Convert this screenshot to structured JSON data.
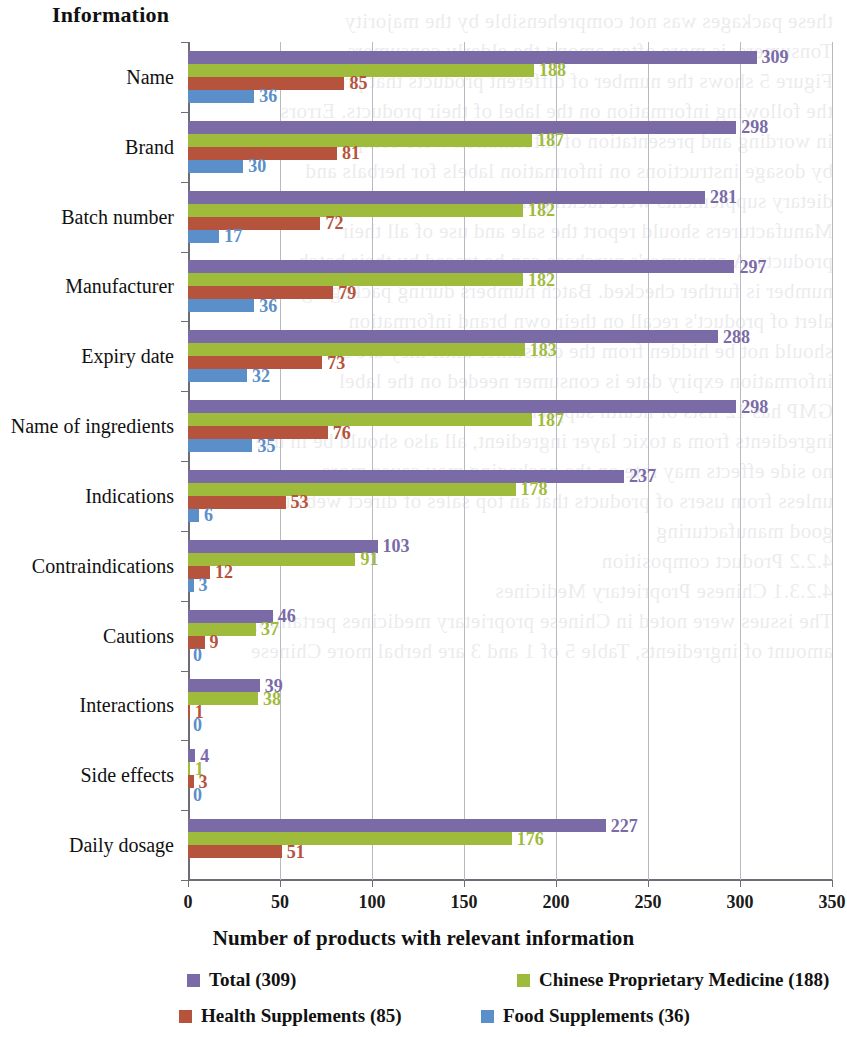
{
  "axis_titles": {
    "y_axis": "Information",
    "x_axis": "Number of products with relevant information"
  },
  "legend": {
    "items": [
      {
        "label": "Total (309)",
        "color": "#7a6aa6",
        "key": "total"
      },
      {
        "label": "Chinese Proprietary Medicine (188)",
        "color": "#9fbb3c",
        "key": "cpm"
      },
      {
        "label": "Health Supplements (85)",
        "color": "#b5533c",
        "key": "health"
      },
      {
        "label": "Food Supplements (36)",
        "color": "#5b8fc9",
        "key": "food"
      }
    ]
  },
  "chart_data": {
    "type": "bar",
    "orientation": "horizontal",
    "title": "",
    "xlabel": "Number of products with relevant information",
    "ylabel": "Information",
    "xlim": [
      0,
      350
    ],
    "xticks": [
      0,
      50,
      100,
      150,
      200,
      250,
      300,
      350
    ],
    "grid": true,
    "legend_position": "bottom",
    "categories": [
      "Name",
      "Brand",
      "Batch number",
      "Manufacturer",
      "Expiry date",
      "Name of ingredients",
      "Indications",
      "Contraindications",
      "Cautions",
      "Interactions",
      "Side effects",
      "Daily dosage"
    ],
    "series": [
      {
        "name": "Total (309)",
        "color": "#7a6aa6",
        "values": [
          309,
          298,
          281,
          297,
          288,
          298,
          237,
          103,
          46,
          39,
          4,
          227
        ],
        "labels": [
          "309",
          "298",
          "281",
          "297",
          "288",
          "298",
          "237",
          "103",
          "46",
          "39",
          "4",
          "227"
        ]
      },
      {
        "name": "Chinese Proprietary Medicine (188)",
        "color": "#9fbb3c",
        "values": [
          188,
          187,
          182,
          182,
          183,
          187,
          178,
          91,
          37,
          38,
          1,
          176
        ],
        "labels": [
          "188",
          "187",
          "182",
          "182",
          "183",
          "187",
          "178",
          "91",
          "37",
          "38",
          "1",
          "176"
        ]
      },
      {
        "name": "Health Supplements (85)",
        "color": "#b5533c",
        "values": [
          85,
          81,
          72,
          79,
          73,
          76,
          53,
          12,
          9,
          1,
          3,
          51
        ],
        "labels": [
          "85",
          "81",
          "72",
          "79",
          "73",
          "76",
          "53",
          "12",
          "9",
          "1",
          "3",
          "51"
        ]
      },
      {
        "name": "Food Supplements (36)",
        "color": "#5b8fc9",
        "values": [
          36,
          30,
          17,
          36,
          32,
          35,
          6,
          3,
          0,
          0,
          0,
          0
        ],
        "labels": [
          "36",
          "30",
          "17",
          "36",
          "32",
          "35",
          "6",
          "3",
          "0",
          "0",
          "0",
          ""
        ]
      }
    ]
  },
  "ghost_text": [
    "these packages was not comprehensible by the majority",
    "Tonsumers, is more often among the elderly consumers",
    "Figure 5 shows the number of different products that provided",
    "the following information on the label of their products. Errors",
    "in wording and presentation of information were compounded",
    "by dosage instructions on information labels for herbals and",
    "dietary supplements were lacking in numbers, percentages",
    "Manufacturers should report the sale and use of all their",
    "products. A consumer's purchase can be traced by their batch",
    "number is further checked. Batch numbers during packaging to",
    "alert of product's recall on their own brand information",
    "should not be hidden from the consumer until they are sure",
    "information expiry date is consumer needed on the label",
    "GMP has 12 lists of health supplements and 4 type of food",
    "ingredients from a toxic layer ingredient, all also should be in use",
    "no side effects may rate on the packaging may cause more",
    "unless from users of products that an top sales of direct websites",
    "good manufacturing",
    "4.2.2  Product composition",
    "4.2.3.1  Chinese Proprietary Medicines",
    "The issues were noted in Chinese proprietary medicines pertaining to",
    "amount of ingredients, Table 5 of 1 and 3 are herbal more Chinese"
  ]
}
